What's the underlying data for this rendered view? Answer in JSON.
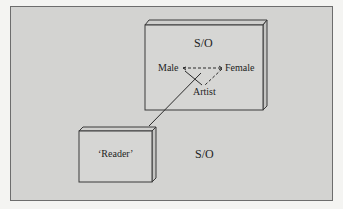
{
  "diagram": {
    "upper_box": {
      "title": "S/O",
      "triangle": {
        "left_node": "Male",
        "right_node": "Female",
        "bottom_node": "Artist"
      }
    },
    "lower_box": {
      "label": "‘Reader’"
    },
    "outside_label": "S/O",
    "colors": {
      "background": "#d3d3d1",
      "box_face": "#d6d6d4",
      "stroke": "#3a3a3a"
    }
  }
}
